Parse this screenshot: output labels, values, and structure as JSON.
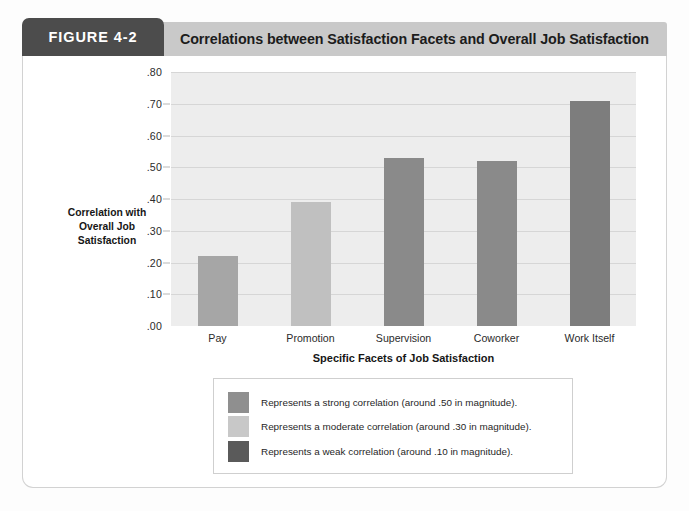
{
  "header": {
    "figure_tab": "FIGURE 4-2",
    "title": "Correlations between Satisfaction Facets and Overall Job Satisfaction"
  },
  "chart_data": {
    "type": "bar",
    "title": "Correlations between Satisfaction Facets and Overall Job Satisfaction",
    "xlabel": "Specific Facets of Job Satisfaction",
    "ylabel": "Correlation with Overall Job Satisfaction",
    "categories": [
      "Pay",
      "Promotion",
      "Supervision",
      "Coworker",
      "Work Itself"
    ],
    "values": [
      0.22,
      0.39,
      0.53,
      0.52,
      0.71
    ],
    "bar_colors": [
      "#a6a6a6",
      "#c0c0c0",
      "#8a8a8a",
      "#8a8a8a",
      "#7d7d7d"
    ],
    "ylim": [
      0.0,
      0.8
    ],
    "ytick_labels": [
      ".00",
      ".10",
      ".20",
      ".30",
      ".40",
      ".50",
      ".60",
      ".70",
      ".80"
    ],
    "ytick_values": [
      0.0,
      0.1,
      0.2,
      0.3,
      0.4,
      0.5,
      0.6,
      0.7,
      0.8
    ],
    "grid": true,
    "legend_position": "below",
    "plot_background": "#ededed"
  },
  "legend": {
    "items": [
      {
        "swatch_color": "#8f8f8f",
        "label": "Represents a strong correlation (around .50 in magnitude)."
      },
      {
        "swatch_color": "#c8c8c8",
        "label": "Represents a moderate correlation (around .30 in magnitude)."
      },
      {
        "swatch_color": "#5a5a5a",
        "label": "Represents a weak correlation (around .10 in magnitude)."
      }
    ]
  }
}
